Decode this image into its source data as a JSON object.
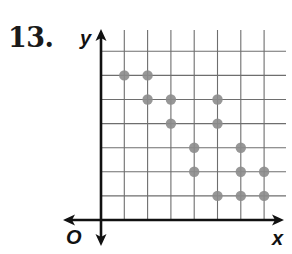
{
  "problem": {
    "number": "13."
  },
  "axes": {
    "x_label": "x",
    "y_label": "y",
    "origin_label": "O"
  },
  "colors": {
    "grid": "#6e6e6e",
    "axis": "#111111",
    "point": "#8c8c8c",
    "background": "#ffffff"
  },
  "chart_data": {
    "type": "scatter",
    "title": "",
    "xlabel": "x",
    "ylabel": "y",
    "xlim": [
      0,
      7.5
    ],
    "ylim": [
      0,
      7.5
    ],
    "grid": true,
    "tick_labels_shown": false,
    "legend": null,
    "origin_label": "O",
    "series": [
      {
        "name": "points",
        "points": [
          {
            "x": 1,
            "y": 6
          },
          {
            "x": 2,
            "y": 6
          },
          {
            "x": 2,
            "y": 5
          },
          {
            "x": 3,
            "y": 5
          },
          {
            "x": 5,
            "y": 5
          },
          {
            "x": 3,
            "y": 4
          },
          {
            "x": 5,
            "y": 4
          },
          {
            "x": 4,
            "y": 3
          },
          {
            "x": 6,
            "y": 3
          },
          {
            "x": 4,
            "y": 2
          },
          {
            "x": 6,
            "y": 2
          },
          {
            "x": 7,
            "y": 2
          },
          {
            "x": 5,
            "y": 1
          },
          {
            "x": 6,
            "y": 1
          },
          {
            "x": 7,
            "y": 1
          }
        ]
      }
    ]
  }
}
